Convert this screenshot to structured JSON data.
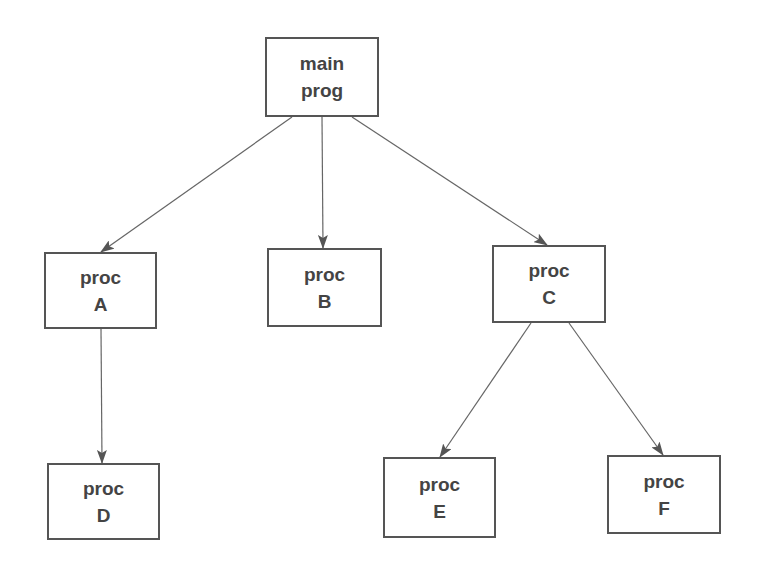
{
  "diagram": {
    "type": "call-tree",
    "colors": {
      "background": "#ffffff",
      "box_border": "#555555",
      "text": "#444444",
      "edge": "#666666"
    },
    "nodes": [
      {
        "id": "main",
        "line1": "main",
        "line2": "prog",
        "x": 265,
        "y": 37,
        "w": 114,
        "h": 80
      },
      {
        "id": "A",
        "line1": "proc",
        "line2": "A",
        "x": 44,
        "y": 252,
        "w": 113,
        "h": 77
      },
      {
        "id": "B",
        "line1": "proc",
        "line2": "B",
        "x": 267,
        "y": 248,
        "w": 115,
        "h": 79
      },
      {
        "id": "C",
        "line1": "proc",
        "line2": "C",
        "x": 492,
        "y": 245,
        "w": 114,
        "h": 78
      },
      {
        "id": "D",
        "line1": "proc",
        "line2": "D",
        "x": 47,
        "y": 463,
        "w": 113,
        "h": 77
      },
      {
        "id": "E",
        "line1": "proc",
        "line2": "E",
        "x": 383,
        "y": 457,
        "w": 113,
        "h": 81
      },
      {
        "id": "F",
        "line1": "proc",
        "line2": "F",
        "x": 607,
        "y": 455,
        "w": 114,
        "h": 79
      }
    ],
    "edges": [
      {
        "from": "main",
        "to": "A",
        "x1": 292,
        "y1": 117,
        "x2": 101,
        "y2": 252
      },
      {
        "from": "main",
        "to": "B",
        "x1": 322,
        "y1": 117,
        "x2": 323,
        "y2": 248
      },
      {
        "from": "main",
        "to": "C",
        "x1": 352,
        "y1": 117,
        "x2": 547,
        "y2": 245
      },
      {
        "from": "A",
        "to": "D",
        "x1": 101,
        "y1": 329,
        "x2": 102,
        "y2": 463
      },
      {
        "from": "C",
        "to": "E",
        "x1": 531,
        "y1": 323,
        "x2": 440,
        "y2": 457
      },
      {
        "from": "C",
        "to": "F",
        "x1": 569,
        "y1": 323,
        "x2": 663,
        "y2": 455
      }
    ]
  }
}
